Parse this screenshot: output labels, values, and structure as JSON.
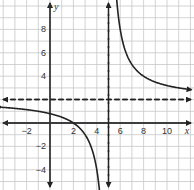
{
  "chart_data": {
    "type": "line",
    "title": "",
    "xlabel": "x",
    "ylabel": "y",
    "xlim": [
      -4.3,
      12.3
    ],
    "ylim": [
      -5.7,
      10.5
    ],
    "grid": true,
    "x_ticks": [
      -2,
      2,
      4,
      6,
      8,
      10
    ],
    "y_ticks": [
      -4,
      -2,
      4,
      6,
      8
    ],
    "x_tick_labels": [
      "−2",
      "2",
      "4",
      "6",
      "8",
      "10"
    ],
    "y_tick_labels": [
      "−4",
      "−2",
      "4",
      "6",
      "8"
    ],
    "function": "y = 6/(x - 5) + 2",
    "asymptotes": {
      "vertical": {
        "x": 5,
        "style": "dashed"
      },
      "horizontal": {
        "y": 2,
        "style": "dashed"
      }
    },
    "series": [
      {
        "name": "left-branch",
        "x": [
          -4.3,
          -2,
          0,
          1,
          2,
          3,
          4,
          4.5,
          4.85
        ],
        "y": [
          1.37,
          1.14,
          0.8,
          0.5,
          0,
          -1,
          -4,
          -10,
          -38
        ]
      },
      {
        "name": "right-branch",
        "x": [
          5.55,
          6,
          7,
          8,
          9,
          10,
          11,
          12.2
        ],
        "y": [
          12.9,
          8,
          5,
          4,
          3.5,
          3.2,
          3,
          2.83
        ]
      }
    ],
    "key_points": [
      {
        "label": "x-intercept",
        "x": 2,
        "y": 0
      }
    ],
    "colors": {
      "grid": "#c8c8c8",
      "axes": "#333333",
      "curve": "#222222",
      "asymptote": "#222222"
    }
  },
  "layout": {
    "width": 194,
    "height": 190,
    "origin_px": [
      50,
      123
    ],
    "px_per_unit": 11.7
  }
}
